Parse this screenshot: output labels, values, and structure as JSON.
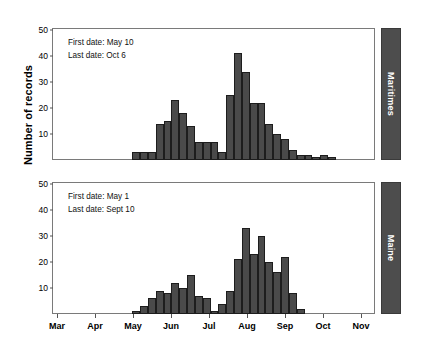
{
  "chart_data": {
    "type": "bar",
    "title": "",
    "xlabel": "",
    "ylabel": "Number of records",
    "ylim": [
      0,
      50
    ],
    "yticks": [
      0,
      10,
      20,
      30,
      40,
      50
    ],
    "grid": false,
    "legend": "none",
    "xtick_labels": [
      "Mar",
      "Apr",
      "May",
      "Jun",
      "Jul",
      "Aug",
      "Sep",
      "Oct",
      "Nov"
    ],
    "bin": "weekly",
    "panels": [
      {
        "name": "Maritimes",
        "strip_label": "Maritimes",
        "annotations": [
          "First date: May 10",
          "Last date: Oct 6"
        ],
        "first_date": "May 10",
        "last_date": "Oct 6",
        "values": [
          0,
          0,
          0,
          0,
          0,
          0,
          0,
          0,
          0,
          0,
          3,
          3,
          3,
          14,
          15,
          23,
          18,
          13,
          7,
          7,
          7,
          3,
          25,
          41,
          34,
          22,
          22,
          14,
          10,
          8,
          4,
          2,
          2,
          1,
          2,
          1,
          0,
          0,
          0,
          0,
          0
        ]
      },
      {
        "name": "Maine",
        "strip_label": "Maine",
        "annotations": [
          "First date: May 1",
          "Last date: Sept 10"
        ],
        "first_date": "May 1",
        "last_date": "Sept 10",
        "values": [
          0,
          0,
          0,
          0,
          0,
          0,
          0,
          0,
          0,
          0,
          1,
          3,
          6,
          9,
          8,
          12,
          10,
          15,
          7,
          6,
          1,
          4,
          9,
          21,
          33,
          23,
          30,
          20,
          16,
          22,
          8,
          2,
          0,
          0,
          0,
          0,
          0,
          0,
          0,
          0,
          0
        ]
      }
    ]
  }
}
